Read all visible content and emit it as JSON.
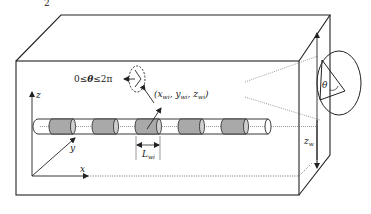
{
  "diagram": {
    "type": "3D schematic",
    "top_label": "2",
    "labels": {
      "angle_range": "0≤θ≤2π",
      "angle_range_parts": {
        "zero": "0≤",
        "theta": "θ",
        "upper": "≤2π"
      },
      "point_coords": "(x",
      "point_coords_parts": {
        "open": "(x",
        "sub_x": "wi",
        "comma1": ", y",
        "sub_y": "wi",
        "comma2": ", z",
        "sub_z": "wi",
        "close": ")"
      },
      "segment_length": "L",
      "segment_length_sub": "wi",
      "axis_x": "x",
      "axis_y": "y",
      "axis_z": "z",
      "theta_in_circle": "θ",
      "z_w_label": "z",
      "z_w_sub": "w"
    },
    "pipe": {
      "shaded_segments": 6,
      "segment_color": "#a9a9a9",
      "pipe_fill": "#ffffff"
    },
    "colors": {
      "line": "#222222",
      "dotted": "#555555",
      "shade": "#a9a9a9"
    }
  }
}
